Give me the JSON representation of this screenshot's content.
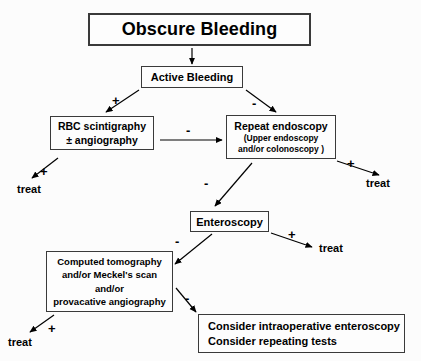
{
  "diagram": {
    "title": "Obscure Bleeding",
    "background_color": "#fcfcfc",
    "line_color": "#000000",
    "box_border_color": "#3a3a3a"
  },
  "nodes": {
    "title": {
      "label": "Obscure Bleeding"
    },
    "active_bleeding": {
      "label": "Active Bleeding"
    },
    "rbc": {
      "line1": "RBC scintigraphy",
      "line2": "± angiography"
    },
    "repeat_endoscopy": {
      "line1": "Repeat endoscopy",
      "line2": "(Upper endoscopy",
      "line3": "and/or colonoscopy )"
    },
    "enteroscopy": {
      "label": "Enteroscopy"
    },
    "ct": {
      "line1": "Computed tomography",
      "line2": "and/or Meckel's scan",
      "line3": "and/or",
      "line4": "provacative angiography"
    },
    "consider": {
      "line1": "Consider intraoperative enteroscopy",
      "line2": "Consider repeating tests"
    }
  },
  "outcomes": {
    "treat_from_rbc": "treat",
    "treat_from_repeat": "treat",
    "treat_from_enteroscopy": "treat",
    "treat_from_ct": "treat"
  },
  "edge_labels": {
    "active_to_rbc": "+",
    "active_to_repeat": "-",
    "rbc_to_repeat": "-",
    "rbc_to_treat": "+",
    "repeat_to_treat": "+",
    "repeat_to_enteroscopy": "-",
    "enteroscopy_to_treat": "+",
    "enteroscopy_to_ct": "-",
    "ct_to_treat": "+",
    "ct_to_consider": "-"
  }
}
